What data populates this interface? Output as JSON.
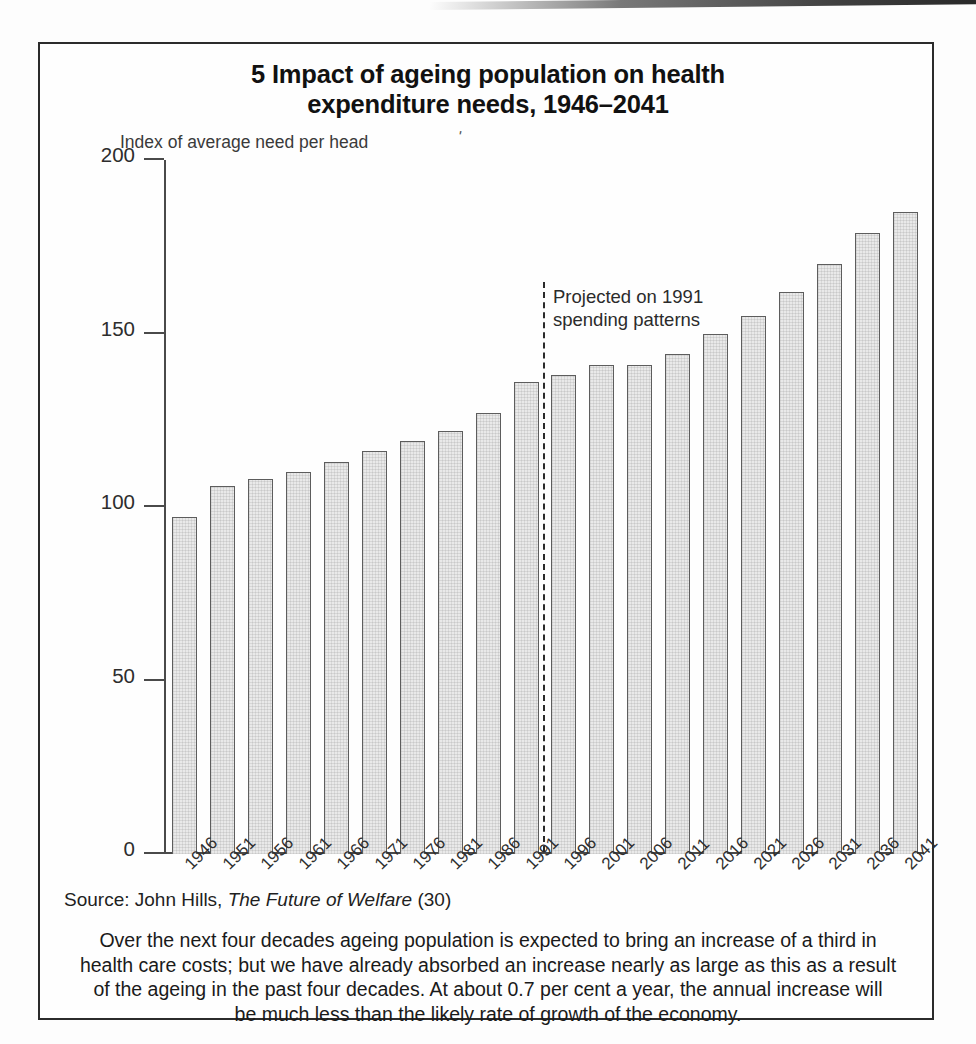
{
  "figure": {
    "number": "5",
    "title_line1": "5 Impact of ageing population on health",
    "title_line2": "expenditure needs, 1946–2041",
    "y_axis_caption": "Index of average need per head",
    "stray_mark": "'",
    "source_prefix": "Source: John Hills,",
    "source_work": "The Future of Welfare",
    "source_suffix": "(30)",
    "caption_line1": "Over the next four decades ageing population is expected to bring an increase of a third in",
    "caption_line2": "health care costs; but we have already absorbed an increase nearly as  large as this as a result",
    "caption_line3": "of the ageing in the past four decades. At about 0.7 per cent a year, the annual increase will",
    "caption_line4": "be much less than the likely rate of growth of the economy."
  },
  "colors": {
    "bar_fill": "#e9e9e9",
    "bar_stroke": "#5d5d5d",
    "axis": "#4a4a4a",
    "frame": "#2b2b2b",
    "text": "#1a1a1a"
  },
  "chart_data": {
    "type": "bar",
    "title": "5 Impact of ageing population on health expenditure needs, 1946–2041",
    "subtitle": "",
    "xlabel": "",
    "ylabel": "Index of average need per head",
    "ylim": [
      0,
      200
    ],
    "yticks": [
      0,
      50,
      100,
      150,
      200
    ],
    "ytick_labels": [
      "0",
      "50",
      "100",
      "150",
      "200"
    ],
    "grid": false,
    "legend": false,
    "categories": [
      "1946",
      "1951",
      "1956",
      "1961",
      "1966",
      "1971",
      "1976",
      "1981",
      "1986",
      "1991",
      "1996",
      "2001",
      "2006",
      "2011",
      "2016",
      "2021",
      "2026",
      "2031",
      "2036",
      "2041"
    ],
    "values": [
      97,
      106,
      108,
      110,
      113,
      116,
      119,
      122,
      127,
      136,
      138,
      141,
      141,
      144,
      150,
      155,
      162,
      170,
      179,
      185
    ],
    "annotations": [
      {
        "type": "vertical-dashed-line",
        "between": [
          "1991",
          "1996"
        ],
        "label_line1": "Projected on 1991",
        "label_line2": "spending patterns"
      }
    ],
    "source": "Source: John Hills, The Future of Welfare (30)"
  }
}
